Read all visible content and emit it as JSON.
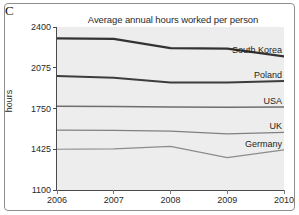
{
  "panel": {
    "letter": "C"
  },
  "chart_data": {
    "type": "line",
    "title": "Average annual hours worked per person",
    "xlabel": "",
    "ylabel": "hours",
    "x": [
      2006,
      2007,
      2008,
      2009,
      2010
    ],
    "xtick_labels": [
      "2006",
      "2007",
      "2008",
      "2009",
      "2010"
    ],
    "ytick_labels": [
      "1100",
      "1425",
      "1750",
      "2075",
      "2400"
    ],
    "yticks": [
      1100,
      1425,
      1750,
      2075,
      2400
    ],
    "ylim": [
      1100,
      2400
    ],
    "xlim": [
      2006,
      2010
    ],
    "grid": false,
    "legend_position": "inline-right",
    "series": [
      {
        "name": "South Korea",
        "label": "South Korea",
        "values": [
          2310,
          2306,
          2232,
          2228,
          2165
        ],
        "color": "#333333",
        "width": 2.2
      },
      {
        "name": "Poland",
        "label": "Poland",
        "values": [
          2010,
          1995,
          1958,
          1958,
          1970
        ],
        "color": "#3d3d3d",
        "width": 2.0
      },
      {
        "name": "USA",
        "label": "USA",
        "values": [
          1768,
          1766,
          1762,
          1760,
          1762
        ],
        "color": "#6e6e6e",
        "width": 1.3
      },
      {
        "name": "UK",
        "label": "UK",
        "values": [
          1578,
          1576,
          1570,
          1548,
          1560
        ],
        "color": "#808080",
        "width": 1.3
      },
      {
        "name": "Germany",
        "label": "Germany",
        "values": [
          1425,
          1428,
          1448,
          1358,
          1420
        ],
        "color": "#8c8c8c",
        "width": 1.2
      }
    ]
  }
}
